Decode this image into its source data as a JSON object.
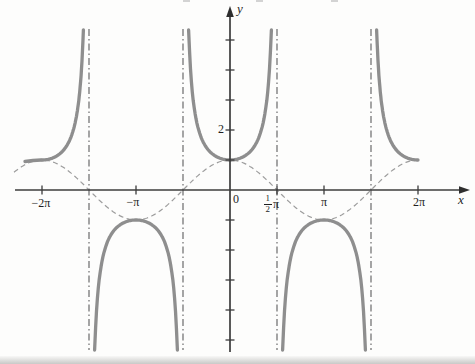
{
  "figure": {
    "background": "#fdfdfc",
    "axis_color": "#3c3c3c",
    "label_color": "#1f1f1f",
    "x_axis_label": "x",
    "y_axis_label": "y",
    "origin_label": "0"
  },
  "chart_data": {
    "type": "line",
    "title": "",
    "xlabel": "x",
    "ylabel": "y",
    "grid": false,
    "legend": "none",
    "functions_depicted": [
      {
        "name": "y = sec x",
        "style": "solid",
        "stroke_width": 3.3,
        "color": "#8e8e8e"
      },
      {
        "name": "y = cos x",
        "style": "dashed",
        "stroke_width": 1.2,
        "color": "#9c9c9c"
      }
    ],
    "x_axis": {
      "label": "x",
      "units": "radians",
      "ticks": [
        {
          "label": "−2π",
          "value_pi": -2
        },
        {
          "label": "−π",
          "value_pi": -1
        },
        {
          "label_fraction": {
            "numerator": "1",
            "denominator": "2",
            "suffix": "π"
          },
          "value_pi": 0.5
        },
        {
          "label": "π",
          "value_pi": 1
        },
        {
          "label": "2π",
          "value_pi": 2
        }
      ]
    },
    "y_axis": {
      "label": "y",
      "labeled_tick": {
        "label": "2",
        "value": 2
      },
      "unlabeled_tick_values": [
        -5,
        -4,
        -3,
        -2,
        -1,
        1,
        3,
        4,
        5
      ]
    },
    "origin_label": "0",
    "asymptotes": {
      "style": "dash-dot",
      "color": "#6b6b6b",
      "values_pi": [
        -1.5,
        -0.5,
        0.5,
        1.5
      ]
    },
    "sec_branches_theta": [
      [
        -6.2832,
        -4.9009
      ],
      [
        -4.5238,
        -1.7594
      ],
      [
        -1.3822,
        1.3822
      ],
      [
        1.7594,
        4.5238
      ],
      [
        4.9009,
        6.2832
      ]
    ],
    "sec_key_points": [
      {
        "x_pi": -2,
        "y": 1
      },
      {
        "x_pi": -1,
        "y": -1
      },
      {
        "x_pi": 0,
        "y": 1
      },
      {
        "x_pi": 1,
        "y": -1
      },
      {
        "x_pi": 2,
        "y": 1
      }
    ],
    "sec_left_tail_px": [
      [
        25,
        161.5
      ],
      [
        33,
        160.5
      ],
      [
        41,
        160
      ]
    ],
    "cos_domain_theta": [
      -7.22,
      6.25
    ],
    "xlim_pi": [
      -2.3,
      2.55
    ],
    "ylim": [
      -5.33,
      5.33
    ],
    "pixel_mapping": {
      "origin_px": [
        230,
        190
      ],
      "px_per_pi": 94,
      "px_per_unit": 30,
      "curve_clip_y_px": [
        29,
        350
      ]
    }
  },
  "artifacts": {
    "top_edge_marks": [
      183,
      256,
      331
    ],
    "bottom_page_edge": true
  }
}
